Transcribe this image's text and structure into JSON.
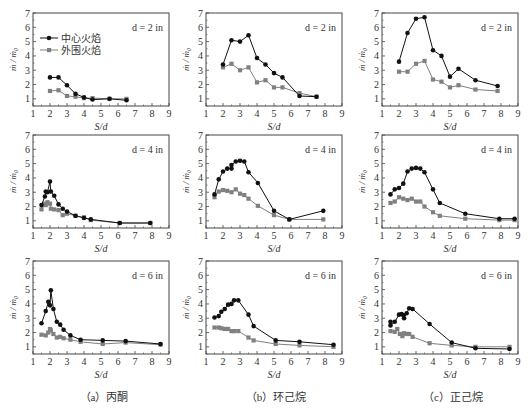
{
  "figure": {
    "legend": {
      "center_flame": "中心火焰",
      "outer_flame": "外围火焰"
    },
    "xlabel": "S/d",
    "ylabel": "ṁ / ṁ₀",
    "captions": [
      "（a）丙酮",
      "（b）环己烷",
      "（c）正己烷"
    ],
    "colors": {
      "center": "#111111",
      "outer": "#808080",
      "frame": "#444444"
    }
  },
  "chart_data": [
    {
      "type": "line",
      "panel": "a",
      "row": 0,
      "col": 0,
      "title": "d = 2 in",
      "xlabel": "S/d",
      "ylabel": "ṁ / ṁ₀",
      "xlim": [
        1,
        9
      ],
      "ylim": [
        0.5,
        7
      ],
      "xticks": [
        1,
        2,
        3,
        4,
        5,
        6,
        7,
        8,
        9
      ],
      "yticks": [
        1,
        2,
        3,
        4,
        5,
        6,
        7
      ],
      "legend_position": "upper left",
      "series": [
        {
          "name": "中心火焰",
          "x": [
            2,
            2.5,
            3,
            3.5,
            4,
            4.5,
            5.5,
            6.5
          ],
          "y": [
            2.5,
            2.5,
            1.95,
            1.35,
            1.1,
            0.95,
            1.0,
            0.9
          ]
        },
        {
          "name": "外围火焰",
          "x": [
            2,
            2.5,
            3,
            3.5,
            4,
            4.5,
            5.5,
            6.5
          ],
          "y": [
            1.55,
            1.6,
            1.2,
            1.15,
            1.05,
            1.05,
            1.0,
            1.0
          ]
        }
      ]
    },
    {
      "type": "line",
      "panel": "b",
      "row": 0,
      "col": 1,
      "title": "d = 2 in",
      "xlabel": "S/d",
      "ylabel": "ṁ / ṁ₀",
      "xlim": [
        1,
        9
      ],
      "ylim": [
        0.5,
        7
      ],
      "xticks": [
        1,
        2,
        3,
        4,
        5,
        6,
        7,
        8,
        9
      ],
      "yticks": [
        1,
        2,
        3,
        4,
        5,
        6,
        7
      ],
      "series": [
        {
          "name": "中心火焰",
          "x": [
            2,
            2.5,
            3,
            3.5,
            4,
            4.5,
            5,
            5.5,
            6.5,
            7.5
          ],
          "y": [
            3.4,
            5.1,
            5.0,
            5.45,
            3.85,
            3.4,
            2.8,
            2.5,
            1.2,
            1.15
          ]
        },
        {
          "name": "外围火焰",
          "x": [
            2,
            2.5,
            3,
            3.5,
            4,
            4.5,
            5,
            5.5,
            6.5,
            7.5
          ],
          "y": [
            3.2,
            3.45,
            3.0,
            3.2,
            2.15,
            2.3,
            1.8,
            1.8,
            1.4,
            1.15
          ]
        }
      ]
    },
    {
      "type": "line",
      "panel": "c",
      "row": 0,
      "col": 2,
      "title": "d = 2 in",
      "xlabel": "S/d",
      "ylabel": "ṁ / ṁ₀",
      "xlim": [
        1,
        9
      ],
      "ylim": [
        0.5,
        7
      ],
      "xticks": [
        1,
        2,
        3,
        4,
        5,
        6,
        7,
        8,
        9
      ],
      "yticks": [
        1,
        2,
        3,
        4,
        5,
        6,
        7
      ],
      "series": [
        {
          "name": "中心火焰",
          "x": [
            2,
            2.5,
            3,
            3.5,
            4,
            4.5,
            5,
            5.5,
            6.5,
            7.8
          ],
          "y": [
            3.6,
            5.6,
            6.6,
            6.7,
            4.4,
            4.0,
            2.55,
            3.1,
            2.3,
            1.9
          ]
        },
        {
          "name": "外围火焰",
          "x": [
            2,
            2.5,
            3,
            3.5,
            4,
            4.5,
            5,
            5.5,
            6.5,
            7.8
          ],
          "y": [
            2.9,
            2.9,
            3.45,
            3.65,
            2.35,
            2.2,
            1.8,
            1.95,
            1.65,
            1.55
          ]
        }
      ]
    },
    {
      "type": "line",
      "panel": "a",
      "row": 1,
      "col": 0,
      "title": "d = 4 in",
      "xlabel": "S/d",
      "ylabel": "ṁ / ṁ₀",
      "xlim": [
        1,
        9
      ],
      "ylim": [
        0.5,
        7
      ],
      "xticks": [
        1,
        2,
        3,
        4,
        5,
        6,
        7,
        8,
        9
      ],
      "yticks": [
        1,
        2,
        3,
        4,
        5,
        6,
        7
      ],
      "series": [
        {
          "name": "中心火焰",
          "x": [
            1.5,
            1.7,
            1.75,
            1.85,
            2,
            2.05,
            2.25,
            2.5,
            2.75,
            3,
            3.5,
            4,
            4.4,
            6.1,
            7.9
          ],
          "y": [
            2.1,
            2.7,
            3.05,
            3.0,
            3.75,
            3.05,
            2.75,
            2.15,
            1.85,
            1.65,
            1.35,
            1.2,
            1.1,
            0.85,
            0.85
          ]
        },
        {
          "name": "外围火焰",
          "x": [
            1.5,
            1.7,
            1.75,
            1.85,
            2,
            2.05,
            2.25,
            2.5,
            2.75,
            3,
            3.5,
            4,
            4.4,
            6.1,
            7.9
          ],
          "y": [
            1.8,
            2.2,
            2.1,
            2.3,
            2.2,
            1.85,
            1.8,
            1.75,
            1.4,
            1.5,
            1.35,
            1.25,
            1.05,
            0.85,
            0.85
          ]
        }
      ]
    },
    {
      "type": "line",
      "panel": "b",
      "row": 1,
      "col": 1,
      "title": "d = 4 in",
      "xlabel": "S/d",
      "ylabel": "ṁ / ṁ₀",
      "xlim": [
        1,
        9
      ],
      "ylim": [
        0.5,
        7
      ],
      "xticks": [
        1,
        2,
        3,
        4,
        5,
        6,
        7,
        8,
        9
      ],
      "yticks": [
        1,
        2,
        3,
        4,
        5,
        6,
        7
      ],
      "series": [
        {
          "name": "中心火焰",
          "x": [
            1.5,
            1.75,
            2,
            2.25,
            2.5,
            2.5,
            2.75,
            3,
            3.25,
            3.5,
            4.05,
            5,
            5.9,
            7.9
          ],
          "y": [
            2.85,
            3.9,
            4.45,
            4.65,
            4.65,
            4.9,
            5.15,
            5.2,
            5.15,
            4.4,
            3.65,
            1.7,
            1.1,
            1.7
          ]
        },
        {
          "name": "外围火焰",
          "x": [
            1.5,
            1.75,
            2,
            2.25,
            2.5,
            2.75,
            3,
            3.25,
            3.5,
            4.05,
            5,
            5.9,
            7.9
          ],
          "y": [
            2.65,
            3.05,
            3.15,
            3.1,
            3.0,
            3.2,
            2.9,
            2.8,
            2.55,
            2.05,
            1.4,
            1.1,
            1.1
          ]
        }
      ]
    },
    {
      "type": "line",
      "panel": "c",
      "row": 1,
      "col": 2,
      "title": "d = 4 in",
      "xlabel": "S/d",
      "ylabel": "ṁ / ṁ₀",
      "xlim": [
        1,
        9
      ],
      "ylim": [
        0.5,
        7
      ],
      "xticks": [
        1,
        2,
        3,
        4,
        5,
        6,
        7,
        8,
        9
      ],
      "yticks": [
        1,
        2,
        3,
        4,
        5,
        6,
        7
      ],
      "series": [
        {
          "name": "中心火焰",
          "x": [
            1.5,
            1.75,
            2,
            2.25,
            2.5,
            2.75,
            3,
            3.25,
            3.5,
            4,
            4.4,
            5.9,
            7.9,
            8.8
          ],
          "y": [
            2.85,
            3.2,
            3.3,
            3.6,
            4.45,
            4.65,
            4.7,
            4.65,
            4.4,
            3.2,
            2.25,
            1.5,
            1.15,
            1.15
          ]
        },
        {
          "name": "外围火焰",
          "x": [
            1.5,
            1.75,
            2,
            2.25,
            2.5,
            2.75,
            3,
            3.25,
            3.5,
            4,
            4.4,
            5.9,
            7.9,
            8.8
          ],
          "y": [
            2.25,
            2.35,
            2.65,
            2.55,
            2.45,
            2.55,
            2.35,
            2.35,
            2.0,
            1.6,
            1.35,
            1.15,
            1.05,
            1.05
          ]
        }
      ]
    },
    {
      "type": "line",
      "panel": "a",
      "row": 2,
      "col": 0,
      "title": "d = 6 in",
      "xlabel": "S/d",
      "ylabel": "ṁ / ṁ₀",
      "xlim": [
        1,
        9
      ],
      "ylim": [
        0.5,
        7
      ],
      "xticks": [
        1,
        2,
        3,
        4,
        5,
        6,
        7,
        8,
        9
      ],
      "yticks": [
        1,
        2,
        3,
        4,
        5,
        6,
        7
      ],
      "series": [
        {
          "name": "中心火焰",
          "x": [
            1.5,
            1.75,
            1.9,
            2,
            2.05,
            2.2,
            2.4,
            2.6,
            2.8,
            3.2,
            3.8,
            5.1,
            6.45,
            8.5
          ],
          "y": [
            2.65,
            3.5,
            4.15,
            3.9,
            4.95,
            3.65,
            2.75,
            2.55,
            2.2,
            1.8,
            1.5,
            1.45,
            1.4,
            1.2
          ]
        },
        {
          "name": "外围火焰",
          "x": [
            1.5,
            1.75,
            1.9,
            2,
            2.05,
            2.2,
            2.4,
            2.6,
            2.8,
            3.2,
            3.8,
            5.1,
            6.45,
            8.5
          ],
          "y": [
            1.85,
            1.8,
            2.0,
            2.25,
            2.15,
            1.9,
            1.65,
            1.7,
            1.6,
            1.5,
            1.35,
            1.2,
            1.3,
            1.15
          ]
        }
      ]
    },
    {
      "type": "line",
      "panel": "b",
      "row": 2,
      "col": 1,
      "title": "d = 6 in",
      "xlabel": "S/d",
      "ylabel": "ṁ / ṁ₀",
      "xlim": [
        1,
        9
      ],
      "ylim": [
        0.5,
        7
      ],
      "xticks": [
        1,
        2,
        3,
        4,
        5,
        6,
        7,
        8,
        9
      ],
      "yticks": [
        1,
        2,
        3,
        4,
        5,
        6,
        7
      ],
      "series": [
        {
          "name": "中心火焰",
          "x": [
            1.5,
            1.75,
            1.9,
            2.1,
            2.3,
            2.5,
            2.65,
            2.9,
            3.5,
            3.8,
            5.1,
            6.5,
            8.5
          ],
          "y": [
            3.05,
            3.15,
            3.45,
            3.65,
            3.95,
            4.0,
            4.25,
            4.25,
            3.25,
            2.45,
            1.45,
            1.35,
            1.15
          ]
        },
        {
          "name": "外围火焰",
          "x": [
            1.5,
            1.75,
            1.9,
            2.1,
            2.3,
            2.5,
            2.65,
            2.9,
            3.5,
            3.8,
            5.1,
            6.5,
            8.5
          ],
          "y": [
            2.35,
            2.35,
            2.3,
            2.25,
            2.25,
            2.1,
            2.1,
            2.1,
            1.65,
            1.45,
            1.2,
            1.1,
            1.0
          ]
        }
      ]
    },
    {
      "type": "line",
      "panel": "c",
      "row": 2,
      "col": 2,
      "title": "d = 6 in",
      "xlabel": "S/d",
      "ylabel": "ṁ / ṁ₀",
      "xlim": [
        1,
        9
      ],
      "ylim": [
        0.5,
        7
      ],
      "xticks": [
        1,
        2,
        3,
        4,
        5,
        6,
        7,
        8,
        9
      ],
      "yticks": [
        1,
        2,
        3,
        4,
        5,
        6,
        7
      ],
      "series": [
        {
          "name": "中心火焰",
          "x": [
            1.5,
            1.5,
            1.75,
            2,
            2.15,
            2.25,
            2.3,
            2.45,
            2.6,
            2.8,
            3.8,
            5.1,
            6.5,
            8.5
          ],
          "y": [
            2.75,
            2.5,
            2.75,
            3.25,
            3.3,
            3.2,
            3.0,
            3.35,
            3.7,
            3.65,
            2.6,
            1.3,
            0.9,
            0.85
          ]
        },
        {
          "name": "外围火焰",
          "x": [
            1.5,
            1.75,
            1.9,
            2.05,
            2.2,
            2.3,
            2.45,
            2.6,
            2.8,
            3.8,
            5.1,
            6.5,
            8.5
          ],
          "y": [
            2.1,
            2.05,
            2.25,
            1.9,
            1.75,
            1.95,
            1.9,
            1.9,
            1.7,
            1.25,
            1.1,
            1.0,
            1.0
          ]
        }
      ]
    }
  ]
}
